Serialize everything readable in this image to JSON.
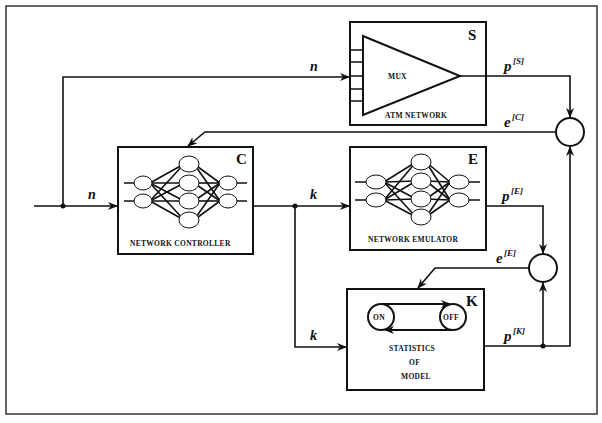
{
  "diagram": {
    "type": "block-diagram",
    "blocks": {
      "S": {
        "letter": "S",
        "inner_label": "MUX",
        "caption": "ATM NETWORK"
      },
      "C": {
        "letter": "C",
        "caption": "NETWORK CONTROLLER"
      },
      "E": {
        "letter": "E",
        "caption": "NETWORK EMULATOR"
      },
      "K": {
        "letter": "K",
        "state_on": "ON",
        "state_off": "OFF",
        "caption_line1": "STATISTICS",
        "caption_line2": "OF",
        "caption_line3": "MODEL"
      }
    },
    "signals": {
      "n_top": "n",
      "n_input": "n",
      "k_to_E": "k",
      "k_to_K": "k",
      "pS_base": "p",
      "pS_sup": "[S]",
      "eC_base": "e",
      "eC_sup": "[C]",
      "pE_base": "p",
      "pE_sup": "[E]",
      "eE_base": "e",
      "eE_sup": "[E]",
      "pK_base": "p",
      "pK_sup": "[K]"
    },
    "colors": {
      "line": "#111111",
      "background": "#ffffff"
    }
  }
}
